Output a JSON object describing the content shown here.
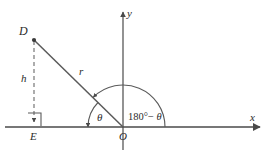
{
  "figure": {
    "type": "geometry-diagram",
    "stroke_color": "#4a4a4a",
    "text_color": "#2b2b2b",
    "background": "#ffffff",
    "labels": {
      "point_d": "D",
      "point_e": "E",
      "origin": "O",
      "height": "h",
      "radius": "r",
      "angle_theta": "θ",
      "supplement_prefix": "180°− ",
      "supplement_theta": "θ",
      "axis_x": "x",
      "axis_y": "y"
    },
    "geometry": {
      "origin": [
        123,
        127
      ],
      "point_d": [
        34,
        40
      ],
      "point_e": [
        34,
        127
      ],
      "x_axis": [
        5,
        127,
        263,
        127
      ],
      "y_axis": [
        123,
        10,
        123,
        150
      ],
      "small_arc_radius": 35,
      "large_arc_radius": 42,
      "theta_degrees": 135,
      "supplement_degrees": 45
    }
  }
}
